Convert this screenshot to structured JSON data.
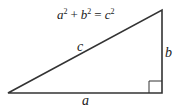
{
  "diagram": {
    "equation": {
      "a": "a",
      "plus": "+",
      "b": "b",
      "equals": "=",
      "c": "c",
      "exp": "2"
    },
    "labels": {
      "hypotenuse": "c",
      "base": "a",
      "height": "b"
    },
    "vertices": {
      "bottom_left": [
        8,
        93
      ],
      "bottom_right": [
        162,
        93
      ],
      "top_right": [
        162,
        10
      ]
    },
    "stroke_color": "#333333"
  }
}
